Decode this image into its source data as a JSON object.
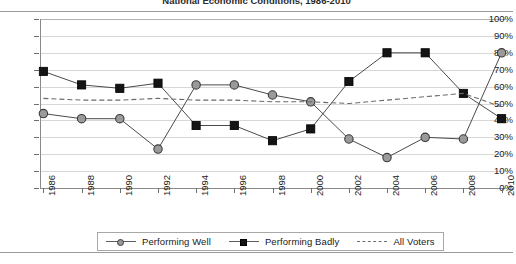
{
  "chart_data": {
    "type": "line",
    "title": "National Economic Conditions, 1986-2010",
    "xlabel": "",
    "ylabel": "",
    "ylim": [
      0,
      100
    ],
    "ytick_labels": [
      "100%",
      "90%",
      "80%",
      "70%",
      "60%",
      "50%",
      "40%",
      "30%",
      "20%",
      "10%",
      "0%"
    ],
    "ytick_values": [
      100,
      90,
      80,
      70,
      60,
      50,
      40,
      30,
      20,
      10,
      0
    ],
    "grid": true,
    "legend_position": "bottom",
    "categories": [
      "1986",
      "1988",
      "1990",
      "1992",
      "1994",
      "1996",
      "1998",
      "2000",
      "2002",
      "2004",
      "2006",
      "2008",
      "2010"
    ],
    "x": [
      1986,
      1988,
      1990,
      1992,
      1994,
      1996,
      1998,
      2000,
      2002,
      2004,
      2006,
      2008,
      2010
    ],
    "series": [
      {
        "name": "Performing Well",
        "marker": "circle",
        "color": "#9a9a9a",
        "line_style": "solid",
        "values": [
          44,
          41,
          41,
          23,
          61,
          61,
          55,
          51,
          29,
          18,
          30,
          29,
          80
        ]
      },
      {
        "name": "Performing Badly",
        "marker": "square",
        "color": "#141414",
        "line_style": "solid",
        "values": [
          69,
          61,
          59,
          62,
          37,
          37,
          28,
          35,
          63,
          80,
          80,
          56,
          41
        ]
      },
      {
        "name": "All Voters",
        "marker": "none",
        "color": "#6a6a6a",
        "line_style": "dashed",
        "values": [
          53,
          52,
          52,
          53,
          52,
          52,
          51,
          51,
          50,
          52,
          54,
          56,
          48
        ]
      }
    ]
  },
  "legend": {
    "items": [
      {
        "label": "Performing Well",
        "key": "gray-circle-line-marker"
      },
      {
        "label": "Performing Badly",
        "key": "black-square-line-marker"
      },
      {
        "label": "All Voters",
        "key": "dashed-line-marker"
      }
    ]
  },
  "colors": {
    "performing_well": "#9a9a9a",
    "performing_badly": "#141414",
    "all_voters": "#6a6a6a",
    "gridline": "#d7d7d7",
    "axis": "#8a8a8a",
    "background": "#ffffff"
  }
}
